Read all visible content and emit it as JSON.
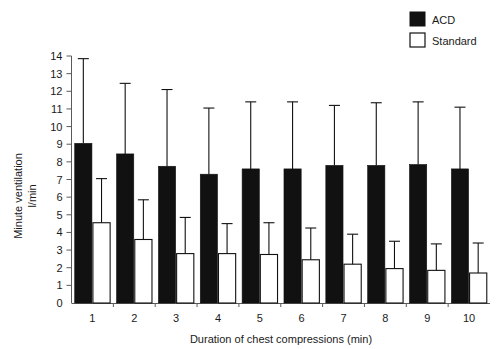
{
  "chart_data": {
    "type": "bar",
    "title": "",
    "xlabel": "Duration of chest compressions (min)",
    "ylabel": "Minute ventilation\nl/min",
    "ylabel_line1": "Minute ventilation",
    "ylabel_line2": "l/min",
    "categories": [
      "1",
      "2",
      "3",
      "4",
      "5",
      "6",
      "7",
      "8",
      "9",
      "10"
    ],
    "ylim": [
      0,
      14
    ],
    "yticks": [
      "0",
      "1",
      "2",
      "3",
      "4",
      "5",
      "6",
      "7",
      "8",
      "9",
      "10",
      "11",
      "12",
      "13",
      "14"
    ],
    "grid": false,
    "legend_position": "top-right",
    "errorbar_style": "upper-only",
    "series": [
      {
        "name": "ACD",
        "color": "#111111",
        "fill": "solid",
        "values": [
          9.05,
          8.45,
          7.75,
          7.3,
          7.6,
          7.6,
          7.8,
          7.8,
          7.85,
          7.6
        ],
        "error_upper": [
          13.85,
          12.45,
          12.1,
          11.05,
          11.4,
          11.4,
          11.2,
          11.35,
          11.4,
          11.1
        ]
      },
      {
        "name": "Standard",
        "color": "#ffffff",
        "fill": "open",
        "values": [
          4.55,
          3.6,
          2.8,
          2.8,
          2.75,
          2.45,
          2.2,
          1.95,
          1.85,
          1.7
        ],
        "error_upper": [
          7.05,
          5.85,
          4.85,
          4.5,
          4.55,
          4.25,
          3.9,
          3.5,
          3.35,
          3.4
        ]
      }
    ]
  },
  "legend": {
    "items": [
      {
        "label": "ACD",
        "swatch": "filled-square"
      },
      {
        "label": "Standard",
        "swatch": "open-square"
      }
    ]
  },
  "colors": {
    "acd": "#111111",
    "standard": "#ffffff",
    "axis": "#5a5a5a",
    "text": "#1a1a1a",
    "background": "#ffffff"
  }
}
